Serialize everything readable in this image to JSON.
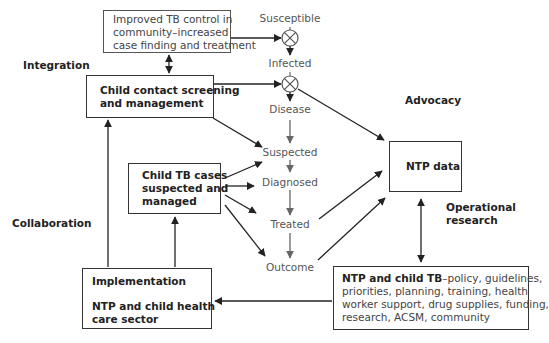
{
  "diagram": {
    "boxes": {
      "community": {
        "lines": [
          "Improved TB control in",
          "community–increased",
          "case finding and treatment"
        ]
      },
      "contact": {
        "lines": [
          "Child contact screening",
          "and management"
        ]
      },
      "cases": {
        "lines": [
          "Child TB cases",
          "suspected and",
          "managed"
        ]
      },
      "ntp_data": {
        "label": "NTP data"
      },
      "implementation": {
        "title": "Implementation",
        "lines": [
          "NTP and child health",
          "care sector"
        ]
      },
      "ntp_child_tb": {
        "bold_lead": "NTP and child TB",
        "line1_rest": "–policy, guidelines,",
        "lines": [
          "priorities, planning, training, health",
          "worker support, drug supplies, funding,",
          "research, ACSM, community"
        ]
      }
    },
    "stages": {
      "susceptible": "Susceptible",
      "infected": "Infected",
      "disease": "Disease",
      "suspected": "Suspected",
      "diagnosed": "Diagnosed",
      "treated": "Treated",
      "outcome": "Outcome"
    },
    "side_labels": {
      "integration": "Integration",
      "collaboration": "Collaboration",
      "advocacy": "Advocacy",
      "operational_research": [
        "Operational",
        "research"
      ]
    },
    "colors": {
      "stroke_dark": "#222222",
      "stroke_grey": "#666666",
      "stage_text": "#555555"
    }
  }
}
